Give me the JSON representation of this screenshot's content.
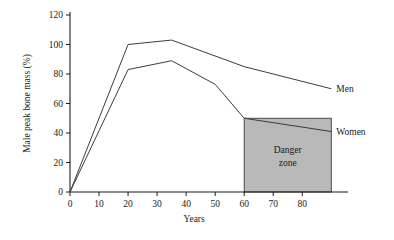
{
  "chart_data": {
    "type": "line",
    "title": "",
    "xlabel": "Years",
    "ylabel": "Male peak bone mass (%)",
    "xlim": [
      0,
      93
    ],
    "ylim": [
      0,
      120
    ],
    "xticks": [
      "0",
      "10",
      "20",
      "30",
      "40",
      "50",
      "60",
      "70",
      "80"
    ],
    "xtick_values": [
      0,
      10,
      20,
      30,
      40,
      50,
      60,
      70,
      80
    ],
    "yticks": [
      "0",
      "20",
      "40",
      "60",
      "80",
      "100",
      "120"
    ],
    "ytick_values": [
      0,
      20,
      40,
      60,
      80,
      100,
      120
    ],
    "grid": false,
    "legend": "inline-right",
    "series": [
      {
        "name": "Men",
        "label": "Men",
        "x": [
          0,
          20,
          35,
          60,
          90
        ],
        "y": [
          0,
          100,
          103,
          85,
          70
        ]
      },
      {
        "name": "Women",
        "label": "Women",
        "x": [
          0,
          20,
          35,
          50,
          60,
          90
        ],
        "y": [
          0,
          83,
          89,
          73,
          50,
          41
        ]
      }
    ],
    "annotations": [
      {
        "name": "danger-zone",
        "label_line1": "Danger",
        "label_line2": "zone",
        "x_range": [
          60,
          90
        ],
        "y_range": [
          0,
          50
        ],
        "fill": "#b9b9b9"
      }
    ]
  },
  "colors": {
    "axis": "#1a1a1a",
    "line": "#3c3c3c",
    "zone_fill": "#b9b9b9",
    "zone_stroke": "#3c3c3c",
    "background": "#ffffff"
  }
}
